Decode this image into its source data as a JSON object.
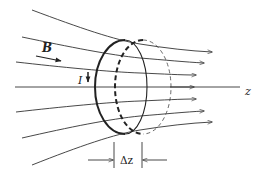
{
  "diagram": {
    "labels": {
      "field": "B",
      "current": "I",
      "axis": "z",
      "displacement": "Δz"
    },
    "colors": {
      "stroke": "#333333",
      "background": "#ffffff"
    },
    "field_lines_count": 7,
    "elements": [
      {
        "name": "z-axis",
        "type": "line"
      },
      {
        "name": "field-lines",
        "type": "curves",
        "count": 7
      },
      {
        "name": "current-loop",
        "type": "ellipse",
        "style": "solid"
      },
      {
        "name": "displaced-loop",
        "type": "ellipse",
        "style": "dashed"
      },
      {
        "name": "delta-z-dimension",
        "type": "dimension-marker"
      }
    ]
  }
}
